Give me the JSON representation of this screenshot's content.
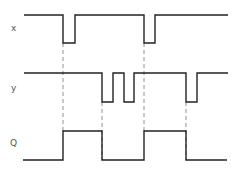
{
  "diagram": {
    "type": "timing",
    "signals": [
      {
        "name": "x",
        "label": "x",
        "label_pos": [
          11,
          24
        ],
        "high_y": 15,
        "low_y": 43,
        "points": [
          [
            24,
            15
          ],
          [
            63,
            15
          ],
          [
            63,
            43
          ],
          [
            75,
            43
          ],
          [
            75,
            15
          ],
          [
            144,
            15
          ],
          [
            144,
            43
          ],
          [
            155,
            43
          ],
          [
            155,
            15
          ],
          [
            228,
            15
          ]
        ]
      },
      {
        "name": "y",
        "label": "y",
        "label_pos": [
          11,
          84
        ],
        "high_y": 73,
        "low_y": 102,
        "points": [
          [
            24,
            73
          ],
          [
            102,
            73
          ],
          [
            102,
            102
          ],
          [
            113,
            102
          ],
          [
            113,
            73
          ],
          [
            124,
            73
          ],
          [
            124,
            102
          ],
          [
            134,
            102
          ],
          [
            134,
            73
          ],
          [
            186,
            73
          ],
          [
            186,
            102
          ],
          [
            197,
            102
          ],
          [
            197,
            73
          ],
          [
            228,
            73
          ]
        ]
      },
      {
        "name": "Q",
        "label": "Q",
        "label_pos": [
          10,
          139
        ],
        "high_y": 131,
        "low_y": 160,
        "points": [
          [
            23,
            160
          ],
          [
            63,
            160
          ],
          [
            63,
            131
          ],
          [
            102,
            131
          ],
          [
            102,
            160
          ],
          [
            144,
            160
          ],
          [
            144,
            131
          ],
          [
            186,
            131
          ],
          [
            186,
            160
          ],
          [
            227,
            160
          ]
        ]
      }
    ],
    "guides": [
      {
        "x": 63,
        "y1": 43,
        "y2": 131
      },
      {
        "x": 102,
        "y1": 102,
        "y2": 160
      },
      {
        "x": 144,
        "y1": 43,
        "y2": 131
      },
      {
        "x": 186,
        "y1": 102,
        "y2": 160
      }
    ],
    "colors": {
      "waveform": "#222222",
      "guide": "#777777",
      "label": "#555555"
    }
  }
}
